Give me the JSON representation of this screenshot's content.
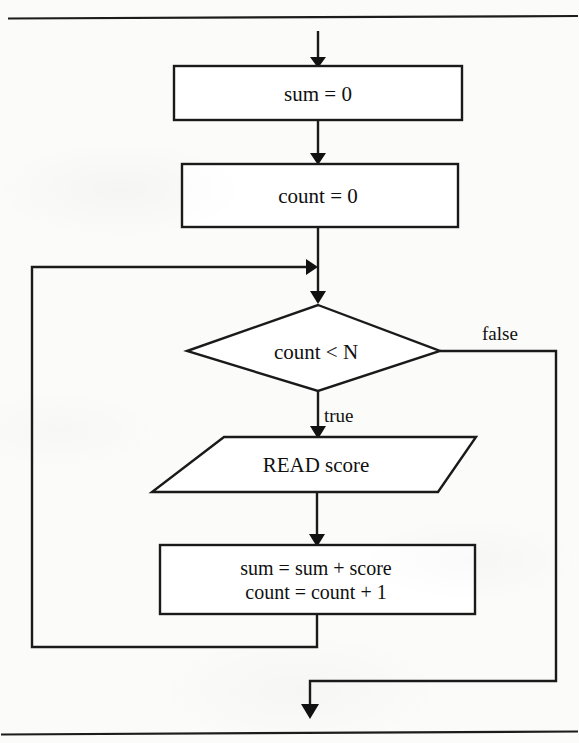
{
  "page": {
    "kind": "flowchart",
    "width": 579,
    "height": 743,
    "ink_color": "#1a1a1a",
    "paper_color": "#fbfbf9"
  },
  "rules": {
    "top_rule": "",
    "bottom_rule": ""
  },
  "nodes": {
    "init_sum": {
      "shape": "process",
      "text": "sum = 0"
    },
    "init_count": {
      "shape": "process",
      "text": "count = 0"
    },
    "decision": {
      "shape": "decision",
      "text": "count < N"
    },
    "read": {
      "shape": "input-output",
      "text": "READ score"
    },
    "accumulate": {
      "shape": "process",
      "line1": "sum = sum + score",
      "line2": "count = count + 1"
    }
  },
  "edge_labels": {
    "decision_false": "false",
    "decision_true": "true"
  }
}
